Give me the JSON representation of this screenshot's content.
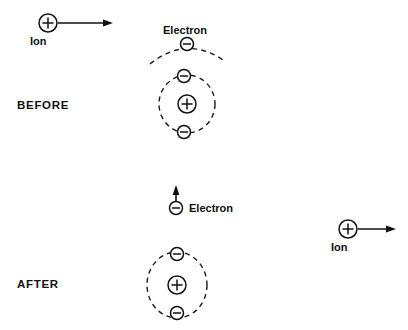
{
  "figure": {
    "width": 408,
    "height": 330,
    "background_color": "#ffffff",
    "ink_color": "#111111"
  },
  "labels": {
    "before": "BEFORE",
    "after": "AFTER",
    "ion_incoming": "Ion",
    "ion_outgoing": "Ion",
    "electron_outer": "Electron",
    "electron_free": "Electron"
  },
  "symbols": {
    "positive": "+",
    "negative": "−"
  },
  "before_scene": {
    "incoming_ion": {
      "label": "Ion",
      "charge": "+",
      "center_x": 48,
      "center_y": 23,
      "radius": 9
    },
    "incoming_arrow": {
      "x1": 58,
      "y1": 23,
      "x2": 113,
      "y2": 23,
      "direction": "right"
    },
    "atom": {
      "nucleus": {
        "charge": "+",
        "center_x": 187,
        "center_y": 104,
        "radius": 9
      },
      "inner_orbit": {
        "center_x": 187,
        "center_y": 104,
        "rx": 28,
        "ry": 29
      },
      "inner_electrons": [
        {
          "charge": "−",
          "center_x": 184,
          "center_y": 76,
          "radius": 6.5
        },
        {
          "charge": "−",
          "center_x": 184,
          "center_y": 132,
          "radius": 6.5
        }
      ],
      "outer_orbit_arc": {
        "label": "Electron",
        "start_x": 150,
        "start_y": 64,
        "end_x": 226,
        "end_y": 62,
        "peak_x": 187,
        "peak_y": 44
      },
      "outer_electron": {
        "charge": "−",
        "center_x": 187,
        "center_y": 44,
        "radius": 6.5
      }
    }
  },
  "after_scene": {
    "free_electron": {
      "label": "Electron",
      "charge": "−",
      "center_x": 176,
      "center_y": 208,
      "radius": 6.5
    },
    "free_electron_arrow": {
      "x1": 176,
      "y1": 200,
      "x2": 176,
      "y2": 186,
      "direction": "up"
    },
    "ion_atom": {
      "nucleus": {
        "charge": "+",
        "center_x": 177,
        "center_y": 285,
        "radius": 9
      },
      "orbit": {
        "center_x": 177,
        "center_y": 285,
        "rx": 30,
        "ry": 33
      },
      "electrons": [
        {
          "charge": "−",
          "center_x": 177,
          "center_y": 254,
          "radius": 6.5
        },
        {
          "charge": "−",
          "center_x": 177,
          "center_y": 313,
          "radius": 6.5
        }
      ]
    },
    "outgoing_ion": {
      "label": "Ion",
      "charge": "+",
      "center_x": 348,
      "center_y": 229,
      "radius": 9
    },
    "outgoing_arrow": {
      "x1": 358,
      "y1": 229,
      "x2": 396,
      "y2": 229,
      "direction": "right"
    }
  }
}
